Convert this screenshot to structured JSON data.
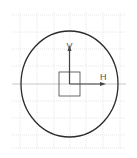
{
  "sketch": {
    "grid": {
      "color": "#dcdcdc",
      "x_lines": [
        20,
        37,
        54,
        70,
        86,
        103,
        120
      ],
      "y_lines": [
        15,
        32,
        49,
        66,
        101,
        118,
        135,
        148
      ],
      "x_extent": [
        12,
        126
      ],
      "y_extent": [
        12,
        150
      ]
    },
    "circle": {
      "cx": 69.5,
      "cy": 84,
      "rx": 48.5,
      "ry": 53,
      "color": "#2b2b2b"
    },
    "axes": {
      "origin": [
        69.5,
        84
      ],
      "color": "#444444",
      "h_axis": {
        "label": "H",
        "end_x": 106,
        "line_start_x": 12,
        "line_end_x": 126
      },
      "v_axis": {
        "label": "V",
        "end_y": 45
      }
    },
    "origin_square": {
      "x": 59,
      "y": 72,
      "w": 21,
      "h": 24,
      "color": "#444444"
    }
  }
}
